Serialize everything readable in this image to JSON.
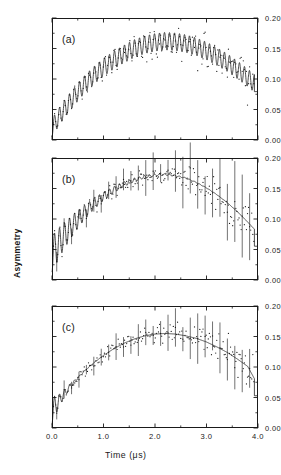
{
  "figure": {
    "axis_label_x": "Time (μs)",
    "axis_label_y": "Asymmetry",
    "panel_tags": [
      "(a)",
      "(b)",
      "(c)"
    ]
  },
  "chart_data": [
    {
      "type": "line",
      "title": "",
      "panel": "(a)",
      "xlabel": "Time (μs)",
      "ylabel": "Asymmetry",
      "xlim": [
        0.0,
        4.0
      ],
      "ylim": [
        0.0,
        0.2
      ],
      "xticks": [
        0.0,
        1.0,
        2.0,
        3.0,
        4.0
      ],
      "xtick_labels": [
        "0.0",
        "1.0",
        "2.0",
        "3.0",
        "4.0"
      ],
      "xminor": [
        0.5,
        1.5,
        2.5,
        3.5
      ],
      "yticks": [
        0.0,
        0.05,
        0.1,
        0.15,
        0.2
      ],
      "ytick_labels": [
        "0.00",
        "0.05",
        "0.10",
        "0.15",
        "0.20"
      ],
      "grid": false,
      "legend": "none",
      "series": [
        {
          "name": "fit",
          "style": "solid-oscillating",
          "description": "Undamped precession riding on a broad asymmetry envelope",
          "envelope_amplitude": 0.0145,
          "oscillation_frequency_mhz": 10.3,
          "envelope": {
            "x": [
              0.0,
              0.2,
              0.4,
              0.6,
              0.8,
              1.0,
              1.2,
              1.4,
              1.6,
              1.8,
              2.0,
              2.2,
              2.4,
              2.6,
              2.8,
              3.0,
              3.2,
              3.4,
              3.6,
              3.8,
              4.0
            ],
            "y": [
              0.02,
              0.046,
              0.068,
              0.088,
              0.105,
              0.119,
              0.131,
              0.141,
              0.15,
              0.156,
              0.16,
              0.162,
              0.161,
              0.158,
              0.153,
              0.146,
              0.137,
              0.127,
              0.115,
              0.102,
              0.088
            ]
          },
          "damping_rate_per_us": 0.0
        },
        {
          "name": "data",
          "style": "points",
          "description": "Scattered measured asymmetry points about the fit"
        }
      ]
    },
    {
      "type": "line",
      "title": "",
      "panel": "(b)",
      "xlabel": "Time (μs)",
      "ylabel": "Asymmetry",
      "xlim": [
        0.0,
        4.0
      ],
      "ylim": [
        0.0,
        0.2
      ],
      "xticks": [
        0.0,
        1.0,
        2.0,
        3.0,
        4.0
      ],
      "xtick_labels": [
        "0.0",
        "1.0",
        "2.0",
        "3.0",
        "4.0"
      ],
      "xminor": [
        0.5,
        1.5,
        2.5,
        3.5
      ],
      "yticks": [
        0.0,
        0.05,
        0.1,
        0.15,
        0.2
      ],
      "ytick_labels": [
        "0.00",
        "0.05",
        "0.10",
        "0.15",
        "0.20"
      ],
      "grid": false,
      "legend": "none",
      "series": [
        {
          "name": "fit",
          "style": "solid-damped-oscillating",
          "description": "Precession damped out by about 1.6 microseconds",
          "envelope_amplitude": 0.03,
          "oscillation_frequency_mhz": 10.3,
          "damping_rate_per_us": 1.45,
          "envelope": {
            "x": [
              0.0,
              0.2,
              0.4,
              0.6,
              0.8,
              1.0,
              1.2,
              1.4,
              1.6,
              1.8,
              2.0,
              2.2,
              2.4,
              2.6,
              2.8,
              3.0,
              3.2,
              3.4,
              3.6,
              3.8,
              4.0
            ],
            "y": [
              0.043,
              0.068,
              0.09,
              0.108,
              0.124,
              0.137,
              0.148,
              0.157,
              0.164,
              0.169,
              0.172,
              0.173,
              0.171,
              0.167,
              0.16,
              0.151,
              0.14,
              0.127,
              0.112,
              0.095,
              0.077
            ]
          }
        },
        {
          "name": "data",
          "style": "points-with-errorbars",
          "description": "Measured asymmetry with vertical error bars growing toward late times"
        }
      ]
    },
    {
      "type": "line",
      "title": "",
      "panel": "(c)",
      "xlabel": "Time (μs)",
      "ylabel": "Asymmetry",
      "xlim": [
        0.0,
        4.0
      ],
      "ylim": [
        0.0,
        0.2
      ],
      "xticks": [
        0.0,
        1.0,
        2.0,
        3.0,
        4.0
      ],
      "xtick_labels": [
        "0.0",
        "1.0",
        "2.0",
        "3.0",
        "4.0"
      ],
      "xminor": [
        0.5,
        1.5,
        2.5,
        3.5
      ],
      "yticks": [
        0.0,
        0.05,
        0.1,
        0.15,
        0.2
      ],
      "ytick_labels": [
        "0.00",
        "0.05",
        "0.10",
        "0.15",
        "0.20"
      ],
      "grid": false,
      "legend": "none",
      "series": [
        {
          "name": "fit",
          "style": "solid-strongly-damped",
          "description": "Precession damped out within the first 0.5 microseconds, smooth envelope thereafter",
          "envelope_amplitude": 0.022,
          "oscillation_frequency_mhz": 10.3,
          "damping_rate_per_us": 5.2,
          "envelope": {
            "x": [
              0.0,
              0.2,
              0.4,
              0.6,
              0.8,
              1.0,
              1.2,
              1.4,
              1.6,
              1.8,
              2.0,
              2.2,
              2.4,
              2.6,
              2.8,
              3.0,
              3.2,
              3.4,
              3.6,
              3.8,
              4.0
            ],
            "y": [
              0.028,
              0.052,
              0.073,
              0.091,
              0.106,
              0.119,
              0.13,
              0.139,
              0.146,
              0.151,
              0.154,
              0.155,
              0.154,
              0.151,
              0.147,
              0.141,
              0.133,
              0.124,
              0.113,
              0.101,
              0.07
            ]
          }
        },
        {
          "name": "data",
          "style": "points-with-errorbars",
          "description": "Measured asymmetry with vertical error bars"
        }
      ]
    }
  ]
}
